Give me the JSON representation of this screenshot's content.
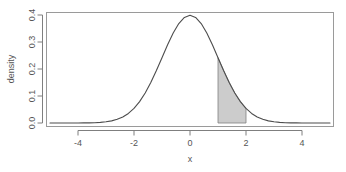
{
  "chart_data": {
    "type": "area",
    "title": "",
    "xlabel": "x",
    "ylabel": "density",
    "xlim": [
      -5,
      5
    ],
    "ylim": [
      0.0,
      0.4
    ],
    "grid": false,
    "legend": null,
    "xticks": [
      "-4",
      "-2",
      "0",
      "2",
      "4"
    ],
    "xtick_values": [
      -4,
      -2,
      0,
      2,
      4
    ],
    "yticks": [
      "0.0",
      "0.1",
      "0.2",
      "0.3",
      "0.4"
    ],
    "ytick_values": [
      0.0,
      0.1,
      0.2,
      0.3,
      0.4
    ],
    "curve": {
      "name": "standard normal density",
      "distribution": "normal",
      "mean": 0,
      "sd": 1,
      "peak_x": 0,
      "peak_y": 0.3989,
      "stroke": "#4d4d4d",
      "x": [
        -5.0,
        -4.8,
        -4.6,
        -4.4,
        -4.2,
        -4.0,
        -3.8,
        -3.6,
        -3.4,
        -3.2,
        -3.0,
        -2.8,
        -2.6,
        -2.4,
        -2.2,
        -2.0,
        -1.8,
        -1.6,
        -1.4,
        -1.2,
        -1.0,
        -0.8,
        -0.6,
        -0.4,
        -0.2,
        0.0,
        0.2,
        0.4,
        0.6,
        0.8,
        1.0,
        1.2,
        1.4,
        1.6,
        1.8,
        2.0,
        2.2,
        2.4,
        2.6,
        2.8,
        3.0,
        3.2,
        3.4,
        3.6,
        3.8,
        4.0,
        4.2,
        4.4,
        4.6,
        4.8,
        5.0
      ],
      "y": [
        0.0,
        0.0,
        0.0,
        0.0,
        0.0001,
        0.0001,
        0.0003,
        0.0006,
        0.0012,
        0.0024,
        0.0044,
        0.0079,
        0.0136,
        0.0224,
        0.0355,
        0.054,
        0.079,
        0.1109,
        0.1497,
        0.1942,
        0.242,
        0.2897,
        0.3332,
        0.3683,
        0.391,
        0.3989,
        0.391,
        0.3683,
        0.3332,
        0.2897,
        0.242,
        0.1942,
        0.1497,
        0.1109,
        0.079,
        0.054,
        0.0355,
        0.0224,
        0.0136,
        0.0079,
        0.0044,
        0.0024,
        0.0012,
        0.0006,
        0.0003,
        0.0001,
        0.0001,
        0.0,
        0.0,
        0.0,
        0.0
      ]
    },
    "shaded_region": {
      "label": "shaded area under curve",
      "x_from": 1,
      "x_to": 2,
      "fill": "#cccccc",
      "stroke": "#808080",
      "area": 0.1359
    },
    "colors": {
      "background": "#ffffff",
      "axis": "#7f7f7f",
      "curve": "#4d4d4d",
      "shade_fill": "#cccccc",
      "shade_stroke": "#808080",
      "text": "#555555"
    }
  }
}
